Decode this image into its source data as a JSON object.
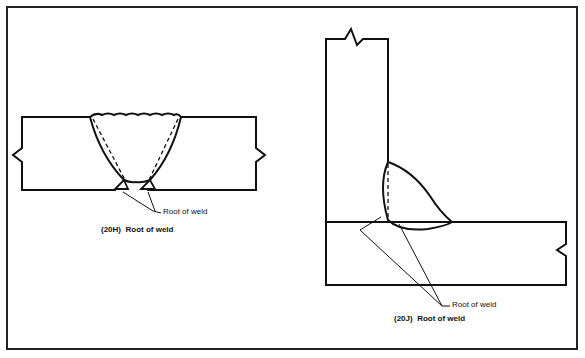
{
  "figure": {
    "left": {
      "id": "20H",
      "caption_id": "(20H)",
      "caption_text": "Root of weld",
      "callout": "Root of weld",
      "description": "Single V-groove butt weld with two root callouts"
    },
    "right": {
      "id": "20J",
      "caption_id": "(20J)",
      "caption_text": "Root of weld",
      "callout": "Root of weld",
      "description": "Fillet weld on T-joint with root callouts"
    }
  },
  "colors": {
    "line": "#111111",
    "background": "#ffffff"
  }
}
